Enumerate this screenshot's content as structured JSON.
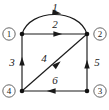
{
  "figure": {
    "kind": "directed-graph-diagram",
    "width": 109,
    "height": 110,
    "background_color": "#ffffff",
    "ink_color": "#1a1a1a",
    "node_outline_color": "#555555"
  },
  "nodes": [
    {
      "id": "n1",
      "label": "1",
      "label_style": "circled",
      "vertex_x": 22,
      "vertex_y": 34,
      "label_x": 9,
      "label_y": 34
    },
    {
      "id": "n2",
      "label": "2",
      "label_style": "circled",
      "vertex_x": 87,
      "vertex_y": 34,
      "label_x": 100,
      "label_y": 34
    },
    {
      "id": "n3",
      "label": "3",
      "label_style": "circled",
      "vertex_x": 87,
      "vertex_y": 91,
      "label_x": 100,
      "label_y": 91
    },
    {
      "id": "n4",
      "label": "4",
      "label_style": "circled",
      "vertex_x": 22,
      "vertex_y": 91,
      "label_x": 9,
      "label_y": 91
    }
  ],
  "edges": [
    {
      "id": "e1",
      "label": "1",
      "from": "n1",
      "to": "n2",
      "shape": "arc",
      "direction": "right",
      "label_x": 55,
      "label_y": 7,
      "path": "M 22 34 C 30 8, 79 8, 87 34",
      "arrow_x": 57,
      "arrow_y": 12.8,
      "arrow_angle": 8
    },
    {
      "id": "e2",
      "label": "2",
      "from": "n1",
      "to": "n2",
      "shape": "straight",
      "direction": "right",
      "label_x": 55,
      "label_y": 24,
      "path": "M 22 34 L 87 34",
      "arrow_x": 58,
      "arrow_y": 34,
      "arrow_angle": 0
    },
    {
      "id": "e3",
      "label": "3",
      "from": "n4",
      "to": "n1",
      "shape": "straight",
      "direction": "up",
      "label_x": 12,
      "label_y": 62,
      "path": "M 22 91 L 22 34",
      "arrow_x": 22,
      "arrow_y": 61,
      "arrow_angle": -90
    },
    {
      "id": "e4",
      "label": "4",
      "from": "n4",
      "to": "n2",
      "shape": "straight",
      "direction": "up-right",
      "label_x": 44,
      "label_y": 58,
      "path": "M 22 91 L 87 34",
      "arrow_x": 57.5,
      "arrow_y": 64.1,
      "arrow_angle": -41.3
    },
    {
      "id": "e5",
      "label": "5",
      "from": "n3",
      "to": "n2",
      "shape": "straight",
      "direction": "up",
      "label_x": 97,
      "label_y": 62,
      "path": "M 87 91 L 87 34",
      "arrow_x": 87,
      "arrow_y": 64,
      "arrow_angle": -90
    },
    {
      "id": "e6",
      "label": "6",
      "from": "n3",
      "to": "n4",
      "shape": "straight",
      "direction": "left",
      "label_x": 55,
      "label_y": 80,
      "path": "M 87 91 L 22 91",
      "arrow_x": 51,
      "arrow_y": 91,
      "arrow_angle": 180
    }
  ]
}
